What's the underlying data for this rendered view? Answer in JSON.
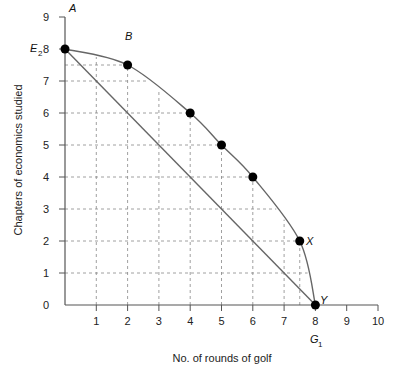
{
  "chart_data": {
    "type": "line",
    "title": "",
    "xlabel": "No. of rounds of golf",
    "ylabel": "Chapters of economics studied",
    "xlim": [
      0,
      10
    ],
    "ylim": [
      0,
      9
    ],
    "x_ticks": [
      "1",
      "2",
      "3",
      "4",
      "5",
      "6",
      "7",
      "8",
      "9",
      "10"
    ],
    "y_ticks": [
      "0",
      "1",
      "2",
      "3",
      "4",
      "5",
      "6",
      "7",
      "8",
      "9"
    ],
    "grid": "dashed, inside curve",
    "series": [
      {
        "name": "Production possibility curve",
        "kind": "curve",
        "points": [
          {
            "x": 0,
            "y": 8,
            "label": "A"
          },
          {
            "x": 2,
            "y": 7.5,
            "label": "B"
          },
          {
            "x": 4,
            "y": 6,
            "label": ""
          },
          {
            "x": 5,
            "y": 5,
            "label": ""
          },
          {
            "x": 6,
            "y": 4,
            "label": ""
          },
          {
            "x": 7.5,
            "y": 2,
            "label": "X"
          },
          {
            "x": 8,
            "y": 0,
            "label": "Y"
          }
        ]
      },
      {
        "name": "Straight line",
        "kind": "line",
        "points": [
          {
            "x": 0,
            "y": 8
          },
          {
            "x": 8,
            "y": 0
          }
        ]
      }
    ],
    "annotations": [
      {
        "text": "E",
        "sub": "2",
        "axis": "y",
        "at": 8
      },
      {
        "text": "G",
        "sub": "1",
        "axis": "x",
        "at": 8
      }
    ]
  },
  "labels": {
    "point_a": "A",
    "point_b": "B",
    "point_x": "X",
    "point_y": "Y",
    "e_main": "E",
    "e_sub": "2",
    "g_main": "G",
    "g_sub": "1"
  }
}
